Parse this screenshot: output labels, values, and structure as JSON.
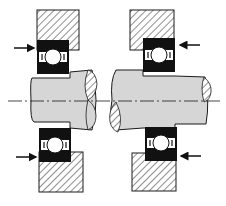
{
  "diagram": {
    "colors": {
      "background": "#ffffff",
      "line": "#1a1a1a",
      "bearing_ring": "#111111",
      "shaft_fill": "#d6d6d6",
      "housing_hatch": "#333333",
      "ball_fill": "#ffffff"
    },
    "arrangements": [
      {
        "id": "left",
        "housing_top": {
          "x": 37,
          "y": 10,
          "w": 42,
          "h": 40
        },
        "housing_bottom": {
          "x": 37,
          "y": 152,
          "w": 44,
          "h": 40
        },
        "bearing_top": {
          "x": 37,
          "y": 40,
          "w": 32,
          "h": 34
        },
        "bearing_bottom": {
          "x": 39,
          "y": 128,
          "w": 32,
          "h": 34
        },
        "arrows": [
          {
            "dir": "right",
            "y": 48
          },
          {
            "dir": "right",
            "y": 157
          }
        ]
      },
      {
        "id": "right",
        "housing_top": {
          "x": 130,
          "y": 10,
          "w": 44,
          "h": 40
        },
        "housing_bottom": {
          "x": 132,
          "y": 153,
          "w": 44,
          "h": 38
        },
        "bearing_top": {
          "x": 143,
          "y": 38,
          "w": 32,
          "h": 34
        },
        "bearing_bottom": {
          "x": 145,
          "y": 127,
          "w": 32,
          "h": 34
        },
        "arrows": [
          {
            "dir": "left",
            "y": 45
          },
          {
            "dir": "left",
            "y": 156
          }
        ]
      }
    ]
  }
}
